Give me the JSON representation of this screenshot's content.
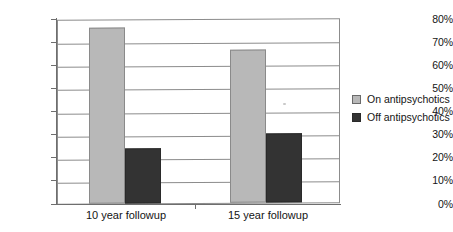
{
  "chart_data": {
    "type": "bar",
    "title": "",
    "xlabel": "",
    "ylabel": "",
    "categories": [
      "10 year followup",
      "15 year followup"
    ],
    "series": [
      {
        "name": "On antipsychotics",
        "values": [
          76,
          66
        ],
        "color": "#b8b8b8"
      },
      {
        "name": "Off antipsychotics",
        "values": [
          24,
          30
        ],
        "color": "#333333"
      }
    ],
    "ylim": [
      0,
      80
    ],
    "ytick_labels": [
      "80%",
      "70%",
      "60%",
      "50%",
      "40%",
      "30%",
      "20%",
      "10%",
      "0%"
    ],
    "ytick_values": [
      80,
      70,
      60,
      50,
      40,
      30,
      20,
      10,
      0
    ],
    "grid": true,
    "legend_position": "right",
    "value_suffix": "%"
  },
  "legend": {
    "items": [
      {
        "label": "On antipsychotics",
        "swatch": "on"
      },
      {
        "label": "Off antipsychotics",
        "swatch": "off"
      }
    ]
  }
}
